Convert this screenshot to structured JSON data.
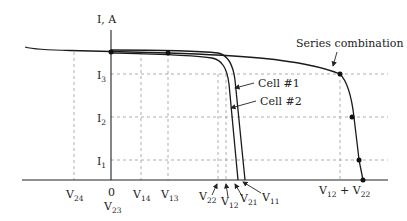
{
  "diagram": {
    "type": "IV-characteristics",
    "y_axis_label": "I, A",
    "current_levels": [
      {
        "id": "I3",
        "base": "I",
        "sub": "3"
      },
      {
        "id": "I2",
        "base": "I",
        "sub": "2"
      },
      {
        "id": "I1",
        "base": "I",
        "sub": "1"
      }
    ],
    "voltage_labels": [
      {
        "id": "V24",
        "base": "V",
        "sub": "24"
      },
      {
        "id": "zero",
        "text": "0"
      },
      {
        "id": "V23",
        "base": "V",
        "sub": "23"
      },
      {
        "id": "V14",
        "base": "V",
        "sub": "14"
      },
      {
        "id": "V13",
        "base": "V",
        "sub": "13"
      },
      {
        "id": "V22",
        "base": "V",
        "sub": "22"
      },
      {
        "id": "V12",
        "base": "V",
        "sub": "12"
      },
      {
        "id": "V21",
        "base": "V",
        "sub": "21"
      },
      {
        "id": "V11",
        "base": "V",
        "sub": "11"
      },
      {
        "id": "V12_plus_V22",
        "base1": "V",
        "sub1": "12",
        "plus": " + ",
        "base2": "V",
        "sub2": "22"
      }
    ],
    "annotations": {
      "series": "Series combination",
      "cell1": "Cell #1",
      "cell2": "Cell #2"
    },
    "colors": {
      "curve": "#1a1a1a",
      "axis": "#222222",
      "dashed": "#999999"
    }
  }
}
